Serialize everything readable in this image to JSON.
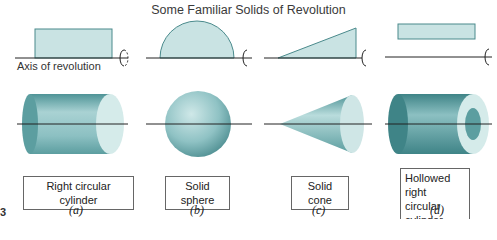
{
  "title": "Some Familiar Solids of Revolution",
  "axis_label": "Axis of revolution",
  "colors": {
    "fill_light": "#c9e3e3",
    "solid_mid": "#8fc2c4",
    "solid_dark": "#4f9497",
    "axis_line": "#222222"
  },
  "panels": [
    {
      "id": "a",
      "profile": "rectangle",
      "solid": "Right circular cylinder",
      "caption": "(a)"
    },
    {
      "id": "b",
      "profile": "semicircle",
      "solid": "Solid sphere",
      "caption": "(b)"
    },
    {
      "id": "c",
      "profile": "right triangle",
      "solid": "Solid cone",
      "caption": "(c)"
    },
    {
      "id": "d",
      "profile": "rectangle above axis",
      "solid_line1": "Hollowed right",
      "solid_line2": "circular cylinder",
      "caption": "(d)"
    }
  ],
  "edge_mark": "3"
}
